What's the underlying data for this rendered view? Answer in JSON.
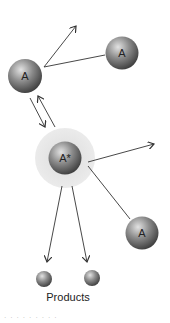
{
  "diagram": {
    "type": "molecular-collision-activation",
    "nodes": [
      {
        "id": "A1",
        "label": "A",
        "kind": "molecule"
      },
      {
        "id": "A2",
        "label": "A",
        "kind": "molecule"
      },
      {
        "id": "Astar",
        "label": "A*",
        "kind": "activated-molecule"
      },
      {
        "id": "A3",
        "label": "A",
        "kind": "molecule"
      },
      {
        "id": "P1",
        "label": "",
        "kind": "product"
      },
      {
        "id": "P2",
        "label": "",
        "kind": "product"
      }
    ],
    "edges": [
      {
        "from": "A1",
        "to": "A2",
        "style": "line"
      },
      {
        "from": "A1",
        "to": "away",
        "style": "arrow"
      },
      {
        "from": "A1",
        "to": "Astar",
        "style": "arrow"
      },
      {
        "from": "Astar",
        "to": "A1",
        "style": "arrow"
      },
      {
        "from": "Astar",
        "to": "away",
        "style": "arrow"
      },
      {
        "from": "Astar",
        "to": "A3",
        "style": "line"
      },
      {
        "from": "Astar",
        "to": "P1",
        "style": "arrow"
      },
      {
        "from": "Astar",
        "to": "P2",
        "style": "arrow"
      }
    ],
    "products_label": "Products",
    "footer_fragment": "· · · · · · · · ·"
  },
  "colors": {
    "sphere_dark": "#3a3a3a",
    "sphere_mid": "#8a8a8a",
    "sphere_light": "#d8d8d8",
    "halo": "#e6e6e6",
    "line": "#333333"
  }
}
